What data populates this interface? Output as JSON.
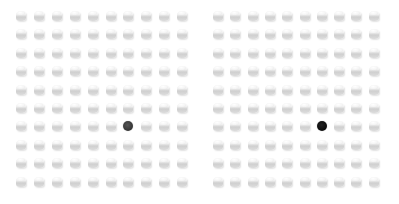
{
  "scene": {
    "description": "Two side-by-side grids of white cylinders, each containing one dark odd-one-out cylinder",
    "background": "#ffffff"
  },
  "panels": [
    {
      "id": "left",
      "rows": 10,
      "cols": 10,
      "origin_x": 21,
      "origin_y": 16,
      "step_x": 17.9,
      "step_y": 18.4,
      "item_color": "#eeeeee",
      "odd_item": {
        "row": 6,
        "col": 6,
        "color": "#333333",
        "highlight": "#555555"
      }
    },
    {
      "id": "right",
      "rows": 10,
      "cols": 10,
      "origin_x": 218,
      "origin_y": 16,
      "step_x": 17.3,
      "step_y": 18.4,
      "item_color": "#eeeeee",
      "odd_item": {
        "row": 6,
        "col": 6,
        "color": "#0a0a0a",
        "highlight": "#222222"
      }
    }
  ]
}
